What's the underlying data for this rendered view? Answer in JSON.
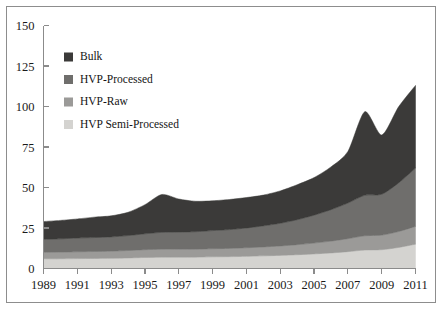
{
  "chart_data": {
    "type": "area",
    "stacked": true,
    "title": "",
    "subtitle": "",
    "xlabel": "",
    "ylabel": "",
    "xlim": [
      1989,
      2011
    ],
    "ylim": [
      0,
      150
    ],
    "grid": false,
    "legend_position": "inside-top-left",
    "x": [
      1989,
      1990,
      1991,
      1992,
      1993,
      1994,
      1995,
      1996,
      1997,
      1998,
      1999,
      2000,
      2001,
      2002,
      2003,
      2004,
      2005,
      2006,
      2007,
      2008,
      2009,
      2010,
      2011
    ],
    "xticks": [
      1989,
      1991,
      1993,
      1995,
      1997,
      1999,
      2001,
      2003,
      2005,
      2007,
      2009,
      2011
    ],
    "xtick_labels": [
      "1989",
      "1991",
      "1993",
      "1995",
      "1997",
      "1999",
      "2001",
      "2003",
      "2005",
      "2007",
      "2009",
      "2011"
    ],
    "yticks": [
      0,
      25,
      50,
      75,
      100,
      125,
      150
    ],
    "ytick_labels": [
      "0",
      "25",
      "50",
      "75",
      "100",
      "125",
      "150"
    ],
    "series": [
      {
        "name": "HVP Semi-Processed",
        "color": "#d4d3d0",
        "values": [
          6.0,
          6.0,
          6.1,
          6.2,
          6.3,
          6.5,
          6.8,
          7.0,
          7.0,
          7.0,
          7.2,
          7.3,
          7.5,
          7.8,
          8.1,
          8.5,
          9.0,
          9.6,
          10.4,
          11.4,
          11.6,
          13.0,
          15.0
        ]
      },
      {
        "name": "HVP-Raw",
        "color": "#9b9a98",
        "values": [
          4.0,
          4.1,
          4.2,
          4.3,
          4.4,
          4.6,
          4.8,
          4.9,
          4.9,
          4.9,
          5.0,
          5.1,
          5.3,
          5.5,
          5.8,
          6.2,
          6.7,
          7.3,
          8.0,
          8.8,
          9.0,
          9.8,
          11.0
        ]
      },
      {
        "name": "HVP-Processed",
        "color": "#6f6e6c",
        "values": [
          8.0,
          8.2,
          8.5,
          8.6,
          8.8,
          9.2,
          9.8,
          10.4,
          10.6,
          10.8,
          11.2,
          11.6,
          12.2,
          13.0,
          14.0,
          15.4,
          17.2,
          19.4,
          22.0,
          25.0,
          25.2,
          30.0,
          36.0
        ]
      },
      {
        "name": "Bulk",
        "color": "#3b3a39",
        "values": [
          11.0,
          11.4,
          11.8,
          12.6,
          13.0,
          14.4,
          18.0,
          23.4,
          20.4,
          18.8,
          18.4,
          18.6,
          18.8,
          19.0,
          20.0,
          21.6,
          23.2,
          26.4,
          31.8,
          51.6,
          36.6,
          47.0,
          51.0
        ]
      }
    ],
    "totals": [
      29.0,
      29.7,
      30.6,
      31.7,
      32.5,
      34.7,
      39.4,
      45.7,
      42.9,
      41.5,
      41.8,
      42.6,
      43.8,
      45.3,
      47.9,
      51.7,
      56.1,
      62.7,
      72.2,
      96.8,
      82.4,
      99.8,
      113.0
    ],
    "legend": [
      {
        "label": "Bulk",
        "color": "#3b3a39"
      },
      {
        "label": "HVP-Processed",
        "color": "#6f6e6c"
      },
      {
        "label": "HVP-Raw",
        "color": "#9b9a98"
      },
      {
        "label": "HVP Semi-Processed",
        "color": "#d4d3d0"
      }
    ]
  },
  "figure": {
    "border_color": "#8d8d8d",
    "axis_color": "#8b8b8b",
    "background": "#ffffff"
  }
}
